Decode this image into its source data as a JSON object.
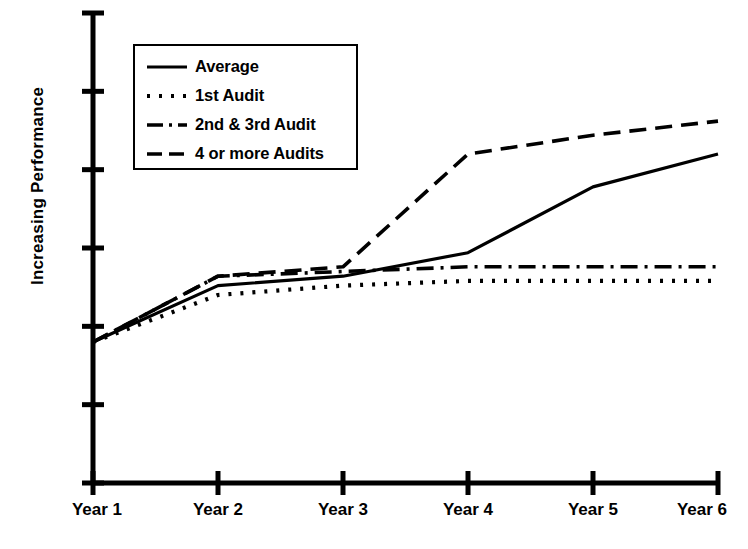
{
  "chart_data": {
    "type": "line",
    "title": "",
    "xlabel": "",
    "ylabel": "Increasing Performance",
    "categories": [
      "Year 1",
      "Year 2",
      "Year 3",
      "Year 4",
      "Year 5",
      "Year 6"
    ],
    "x": [
      1,
      2,
      3,
      4,
      5,
      6
    ],
    "ylim": [
      0,
      100
    ],
    "xlim": [
      1,
      6
    ],
    "grid": false,
    "y_axis_numeric_labels": false,
    "y_tick_count": 7,
    "legend_position": "top-left",
    "note": "Y axis is qualitative (tick marks only, no numeric labels); values below are normalized 0-100 read off tick spacing.",
    "series": [
      {
        "name": "Average",
        "style": "solid",
        "values": [
          30,
          42,
          44,
          49,
          63,
          70
        ]
      },
      {
        "name": "1st Audit",
        "style": "dotted",
        "values": [
          30,
          40,
          42,
          43,
          43,
          43
        ]
      },
      {
        "name": "2nd & 3rd Audit",
        "style": "dash-dot",
        "values": [
          30,
          44,
          45,
          46,
          46,
          46
        ]
      },
      {
        "name": "4 or more Audits",
        "style": "dashed",
        "values": [
          30,
          44,
          46,
          70,
          74,
          77
        ]
      }
    ]
  },
  "axis": {
    "y_title": "Increasing Performance",
    "x_tick_labels": [
      "Year 1",
      "Year 2",
      "Year 3",
      "Year 4",
      "Year 5",
      "Year 6"
    ]
  },
  "legend": {
    "items": [
      {
        "label": "Average",
        "style": "solid"
      },
      {
        "label": "1st Audit",
        "style": "dotted"
      },
      {
        "label": "2nd & 3rd Audit",
        "style": "dash-dot"
      },
      {
        "label": "4 or more Audits",
        "style": "dashed"
      }
    ]
  },
  "colors": {
    "ink": "#000000",
    "background": "#ffffff"
  }
}
